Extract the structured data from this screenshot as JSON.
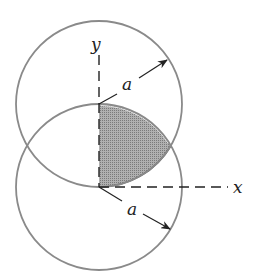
{
  "diagram": {
    "type": "geometry",
    "labels": {
      "x_axis": "x",
      "y_axis": "y",
      "radius_upper": "a",
      "radius_lower": "a"
    },
    "colors": {
      "circle_stroke": "#8a8a8a",
      "axis_stroke": "#222222",
      "shade_fill": "#9a9a9a",
      "background": "#ffffff"
    },
    "geometry": {
      "origin": [
        99,
        187
      ],
      "radius_px": 83,
      "upper_circle_center": [
        99,
        104
      ],
      "lower_circle_center": [
        99,
        187
      ],
      "intersection_right": [
        171,
        145.5
      ],
      "intersection_left": [
        27,
        145.5
      ]
    }
  }
}
